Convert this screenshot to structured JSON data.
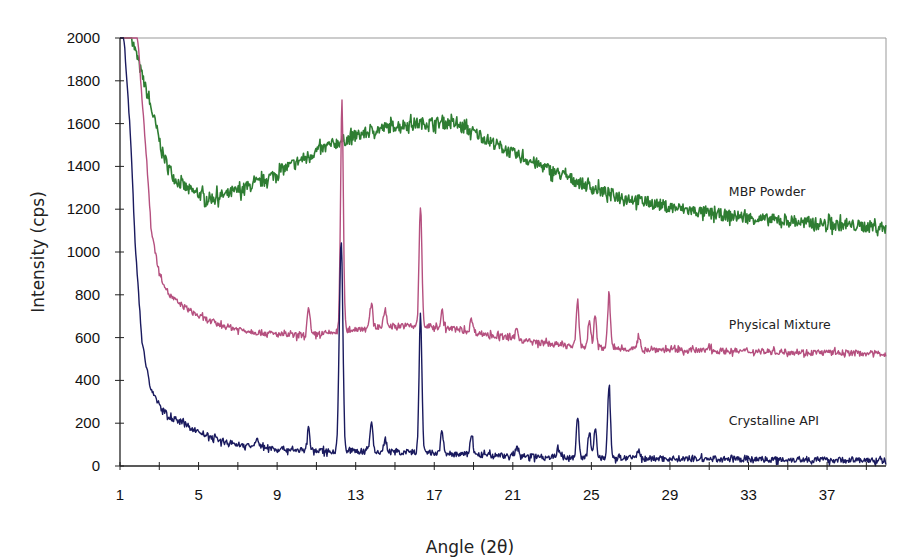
{
  "chart_data": {
    "type": "line",
    "title": "",
    "xlabel": "Angle (2θ)",
    "ylabel": "Intensity (cps)",
    "xlim": [
      1,
      40
    ],
    "ylim": [
      0,
      2000
    ],
    "x_ticks": [
      1,
      5,
      9,
      13,
      17,
      21,
      25,
      29,
      33,
      37
    ],
    "x_minor_step": 2,
    "y_ticks": [
      0,
      200,
      400,
      600,
      800,
      1000,
      1200,
      1400,
      1600,
      1800,
      2000
    ],
    "grid": false,
    "legend_position": "inline-right",
    "series": [
      {
        "name": "MBP Powder",
        "color": "#2e7d32",
        "label_pos": [
          32,
          1260
        ],
        "baseline_points": [
          [
            1.6,
            2000
          ],
          [
            2.2,
            1800
          ],
          [
            2.8,
            1600
          ],
          [
            3.2,
            1450
          ],
          [
            3.8,
            1340
          ],
          [
            4.5,
            1290
          ],
          [
            5.5,
            1250
          ],
          [
            6.5,
            1270
          ],
          [
            8,
            1320
          ],
          [
            9,
            1370
          ],
          [
            10,
            1420
          ],
          [
            11,
            1470
          ],
          [
            12,
            1510
          ],
          [
            13,
            1540
          ],
          [
            14,
            1570
          ],
          [
            15,
            1590
          ],
          [
            16,
            1600
          ],
          [
            17,
            1605
          ],
          [
            18,
            1600
          ],
          [
            19,
            1560
          ],
          [
            20,
            1510
          ],
          [
            21,
            1460
          ],
          [
            22,
            1420
          ],
          [
            23,
            1380
          ],
          [
            24,
            1340
          ],
          [
            25,
            1300
          ],
          [
            26,
            1270
          ],
          [
            27,
            1250
          ],
          [
            28,
            1230
          ],
          [
            29,
            1210
          ],
          [
            30,
            1195
          ],
          [
            31,
            1180
          ],
          [
            32,
            1170
          ],
          [
            33,
            1160
          ],
          [
            34,
            1150
          ],
          [
            35,
            1145
          ],
          [
            36,
            1135
          ],
          [
            37,
            1130
          ],
          [
            38,
            1125
          ],
          [
            39,
            1120
          ],
          [
            40,
            1115
          ]
        ],
        "noise": 28,
        "peaks": []
      },
      {
        "name": "Physical Mixture",
        "color": "#b5507f",
        "label_pos": [
          32,
          640
        ],
        "baseline_points": [
          [
            1.9,
            2000
          ],
          [
            2.3,
            1500
          ],
          [
            2.6,
            1100
          ],
          [
            3,
            900
          ],
          [
            3.5,
            800
          ],
          [
            4,
            760
          ],
          [
            5,
            700
          ],
          [
            6,
            660
          ],
          [
            7,
            640
          ],
          [
            8,
            625
          ],
          [
            9,
            615
          ],
          [
            10,
            610
          ],
          [
            11,
            615
          ],
          [
            12,
            625
          ],
          [
            13,
            640
          ],
          [
            14,
            650
          ],
          [
            15,
            655
          ],
          [
            16,
            655
          ],
          [
            17,
            650
          ],
          [
            18,
            640
          ],
          [
            19,
            625
          ],
          [
            20,
            610
          ],
          [
            21,
            595
          ],
          [
            22,
            580
          ],
          [
            23,
            570
          ],
          [
            24,
            560
          ],
          [
            26,
            550
          ],
          [
            28,
            545
          ],
          [
            30,
            540
          ],
          [
            34,
            535
          ],
          [
            40,
            525
          ]
        ],
        "noise": 14,
        "peaks": [
          [
            10.6,
            120
          ],
          [
            12.3,
            1080
          ],
          [
            13.8,
            110
          ],
          [
            14.5,
            80
          ],
          [
            16.3,
            560
          ],
          [
            17.4,
            70
          ],
          [
            18.9,
            60
          ],
          [
            21.2,
            50
          ],
          [
            24.3,
            210
          ],
          [
            24.9,
            130
          ],
          [
            25.2,
            150
          ],
          [
            25.9,
            250
          ],
          [
            27.4,
            50
          ],
          [
            31,
            30
          ]
        ]
      },
      {
        "name": "Crystalline API",
        "color": "#1a1a5e",
        "label_pos": [
          32,
          190
        ],
        "baseline_points": [
          [
            1.2,
            2000
          ],
          [
            1.5,
            1600
          ],
          [
            1.8,
            1000
          ],
          [
            2.1,
            600
          ],
          [
            2.5,
            380
          ],
          [
            3,
            280
          ],
          [
            3.5,
            230
          ],
          [
            4,
            210
          ],
          [
            5,
            160
          ],
          [
            6,
            120
          ],
          [
            7,
            100
          ],
          [
            8,
            90
          ],
          [
            9,
            80
          ],
          [
            10,
            75
          ],
          [
            11,
            70
          ],
          [
            12,
            70
          ],
          [
            13,
            70
          ],
          [
            14,
            65
          ],
          [
            15,
            65
          ],
          [
            16,
            65
          ],
          [
            17,
            60
          ],
          [
            18,
            55
          ],
          [
            20,
            50
          ],
          [
            22,
            45
          ],
          [
            24,
            40
          ],
          [
            26,
            38
          ],
          [
            28,
            35
          ],
          [
            32,
            32
          ],
          [
            36,
            30
          ],
          [
            40,
            25
          ]
        ],
        "noise": 14,
        "peaks": [
          [
            8,
            40
          ],
          [
            10.6,
            100
          ],
          [
            12.2,
            560
          ],
          [
            12.3,
            690
          ],
          [
            13.8,
            140
          ],
          [
            14.5,
            60
          ],
          [
            16.3,
            640
          ],
          [
            17.4,
            100
          ],
          [
            18.9,
            100
          ],
          [
            21.2,
            40
          ],
          [
            23.3,
            40
          ],
          [
            24.3,
            180
          ],
          [
            24.9,
            120
          ],
          [
            25.2,
            130
          ],
          [
            25.9,
            340
          ],
          [
            27.4,
            40
          ]
        ]
      }
    ]
  },
  "axes": {
    "x_title": "Angle (2θ)",
    "y_title": "Intensity (cps)"
  }
}
